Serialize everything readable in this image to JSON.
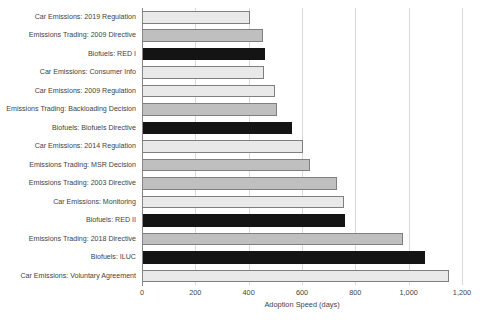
{
  "chart_data": {
    "type": "bar",
    "orientation": "horizontal",
    "title": "",
    "xlabel": "Adoption Speed (days)",
    "ylabel": "",
    "xlim": [
      0,
      1200
    ],
    "xticks": [
      0,
      200,
      400,
      600,
      800,
      1000,
      1200
    ],
    "xticklabels": [
      "0",
      "200",
      "400",
      "600",
      "800",
      "1,000",
      "1,200"
    ],
    "grid": "vertical",
    "legend": "none",
    "categories": [
      "Car Emissions: 2019 Regulation",
      "Emissions Trading: 2009 Directive",
      "Biofuels: RED I",
      "Car Emissions: Consumer Info",
      "Car Emissions: 2009 Regulation",
      "Emissions Trading: Backloading Decision",
      "Biofuels: Biofuels Directive",
      "Car Emissions: 2014 Regulation",
      "Emissions Trading: MSR Decision",
      "Emissions Trading: 2003 Directive",
      "Car Emissions: Monitoring",
      "Biofuels: RED II",
      "Emissions Trading: 2018 Directive",
      "Biofuels: ILUC",
      "Car Emissions: Voluntary Agreement"
    ],
    "values": [
      405,
      455,
      460,
      458,
      500,
      508,
      563,
      604,
      630,
      731,
      757,
      762,
      980,
      1062,
      1150
    ],
    "groups": [
      "Car Emissions",
      "Emissions Trading",
      "Biofuels",
      "Car Emissions",
      "Car Emissions",
      "Emissions Trading",
      "Biofuels",
      "Car Emissions",
      "Emissions Trading",
      "Emissions Trading",
      "Car Emissions",
      "Biofuels",
      "Emissions Trading",
      "Biofuels",
      "Car Emissions"
    ],
    "series_colors": {
      "Car Emissions": "#e9e9e9",
      "Emissions Trading": "#bfbfbf",
      "Biofuels": "#141414"
    },
    "bar_outline_color": "#7f7f7f",
    "gridline_color": "#d9d9d9",
    "axis_color": "#868686",
    "background_color": "#ffffff"
  }
}
